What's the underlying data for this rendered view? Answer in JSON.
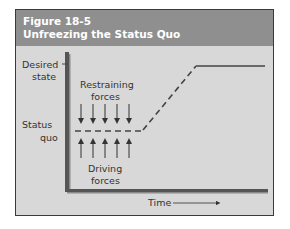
{
  "figure": {
    "number": "Figure 18-5",
    "title": "Unfreezing the Status Quo"
  },
  "diagram": {
    "y_labels": {
      "desired_state_line1": "Desired",
      "desired_state_line2": "state",
      "status_quo_line1": "Status",
      "status_quo_line2": "quo"
    },
    "restraining_forces_line1": "Restraining",
    "restraining_forces_line2": "forces",
    "driving_forces_line1": "Driving",
    "driving_forces_line2": "forces",
    "x_axis_label": "Time",
    "restraining_arrow_count": 5,
    "driving_arrow_count": 5,
    "colors": {
      "header": "#8f8f8f",
      "panel": "#d8d8d8",
      "axis": "#555555",
      "line": "#444444"
    }
  }
}
